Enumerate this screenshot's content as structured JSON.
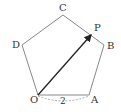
{
  "diagram": {
    "vertices": {
      "O": {
        "label": "O",
        "x": 38,
        "y": 95
      },
      "A": {
        "label": "A",
        "x": 89,
        "y": 95
      },
      "B": {
        "label": "B",
        "x": 104,
        "y": 45
      },
      "C": {
        "label": "C",
        "x": 63,
        "y": 15
      },
      "D": {
        "label": "D",
        "x": 22,
        "y": 45
      }
    },
    "point_P": {
      "label": "P",
      "x": 92,
      "y": 34
    },
    "side_length_label": "2",
    "colors": {
      "edge": "#888888",
      "vector": "#222222",
      "text": "#333333"
    }
  }
}
